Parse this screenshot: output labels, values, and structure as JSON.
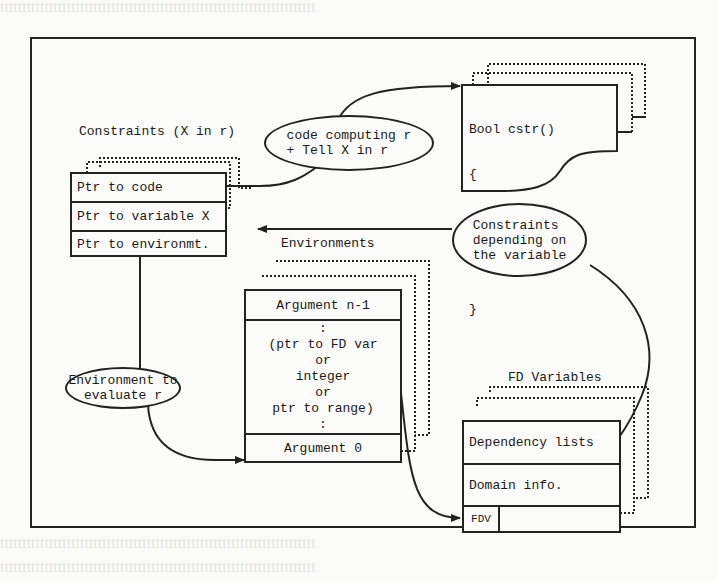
{
  "diagram": {
    "constraints": {
      "title": "Constraints (X in r)",
      "rows": [
        "Ptr to code",
        "Ptr to variable X",
        "Ptr to environmt."
      ]
    },
    "code_bubble": {
      "line1": "code computing r",
      "line2": "+ Tell X in r"
    },
    "code_doc": {
      "lines": [
        "Bool cstr()",
        "{",
        " eval(r);",
        " Tell(X,r);",
        "}"
      ]
    },
    "dependents_bubble": {
      "line1": "Constraints",
      "line2": "depending on",
      "line3": "the variable"
    },
    "environments": {
      "title": "Environments",
      "top_row": "Argument n-1",
      "middle": [
        ":",
        "(ptr to FD var",
        "or",
        "integer",
        "or",
        "ptr to range)",
        ":"
      ],
      "bottom_row": "Argument 0"
    },
    "env_bubble": {
      "line1": "Environment to",
      "line2": "evaluate r"
    },
    "fd_variables": {
      "title": "FD Variables",
      "rows": [
        "Dependency lists",
        "Domain info."
      ],
      "fdv_label": "FDV"
    }
  }
}
